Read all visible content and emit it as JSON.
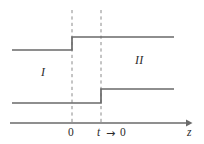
{
  "figure": {
    "background_color": "#ffffff",
    "line_color": "#6a6a6a",
    "dash_color": "#8a8a8a",
    "axis_color": "#6a6a6a",
    "text_color": "#2b2b2b",
    "region_labels": {
      "left": "I",
      "right": "II"
    },
    "axis": {
      "x_label": "z",
      "ticks": [
        {
          "label": "0",
          "x": 72
        },
        {
          "label": "t",
          "x": 101
        }
      ],
      "limit_annotation": {
        "variable": "t",
        "arrow": "→",
        "value": "0"
      }
    }
  },
  "chart_data": {
    "type": "line",
    "title": "",
    "subtitle": "",
    "xlabel": "z",
    "ylabel": "",
    "grid": false,
    "legend_position": "none",
    "xlim": [
      0,
      204
    ],
    "ylim": [
      144,
      0
    ],
    "annotations": [
      {
        "text": "I",
        "x": 45,
        "y": 72,
        "style": "italic"
      },
      {
        "text": "II",
        "x": 140,
        "y": 60,
        "style": "italic"
      },
      {
        "text": "0",
        "x": 72,
        "y": 133,
        "style": "normal"
      },
      {
        "text": "t",
        "x": 101,
        "y": 133,
        "style": "italic"
      },
      {
        "text": "→",
        "x": 112,
        "y": 133,
        "style": "normal"
      },
      {
        "text": "0",
        "x": 124,
        "y": 133,
        "style": "normal"
      },
      {
        "text": "z",
        "x": 191,
        "y": 133,
        "style": "italic"
      }
    ],
    "series": [
      {
        "name": "upper-step",
        "type": "step",
        "step_at_x": 72,
        "points": [
          {
            "x": 12,
            "y": 50
          },
          {
            "x": 72,
            "y": 50
          },
          {
            "x": 72,
            "y": 37
          },
          {
            "x": 174,
            "y": 37
          }
        ]
      },
      {
        "name": "lower-step",
        "type": "step",
        "step_at_x": 101,
        "points": [
          {
            "x": 12,
            "y": 103
          },
          {
            "x": 101,
            "y": 103
          },
          {
            "x": 101,
            "y": 89
          },
          {
            "x": 174,
            "y": 89
          }
        ]
      }
    ],
    "reference_lines": [
      {
        "name": "z-equals-0",
        "x": 72,
        "y_start": 10,
        "y_end": 122,
        "style": "dashed"
      },
      {
        "name": "z-equals-t",
        "x": 101,
        "y_start": 10,
        "y_end": 122,
        "style": "dashed"
      }
    ],
    "axis_geometry": {
      "y": 123,
      "x_start": 10,
      "x_end": 190,
      "arrowhead": true
    }
  }
}
